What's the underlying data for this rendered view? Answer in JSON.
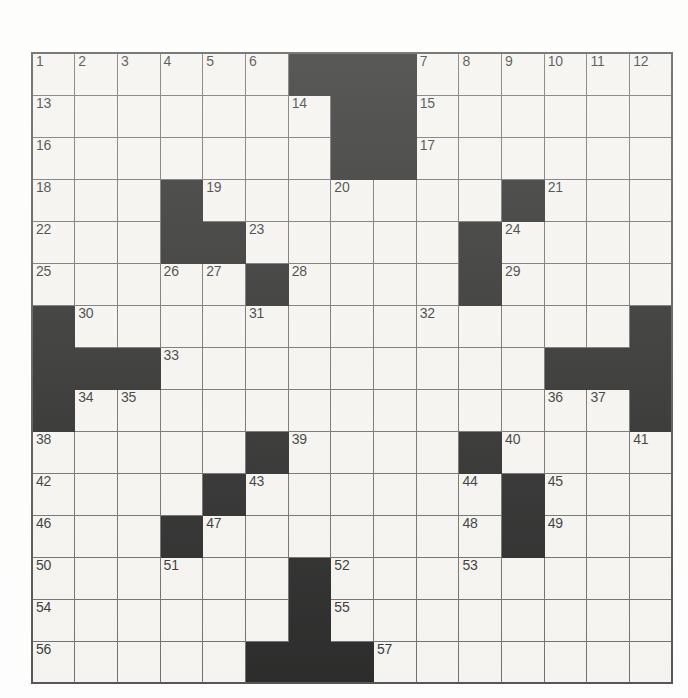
{
  "page": {
    "background_color": "#ffffff",
    "width": 688,
    "height": 698
  },
  "grid": {
    "name": "crossword-grid",
    "rows": 15,
    "cols": 15,
    "cell_color": "#f4f3f0",
    "block_color": "#080808",
    "line_color": "#5a5a58",
    "number_color": "#141414",
    "blocks": [
      [
        6,
        7,
        8
      ],
      [
        7,
        8
      ],
      [
        7,
        8
      ],
      [
        3,
        11
      ],
      [
        3,
        4,
        10
      ],
      [
        5,
        10
      ],
      [
        0,
        14
      ],
      [
        0,
        1,
        2,
        12,
        13,
        14
      ],
      [
        0,
        14
      ],
      [
        5,
        10
      ],
      [
        4,
        11
      ],
      [
        3,
        11
      ],
      [
        6
      ],
      [
        6
      ],
      [
        5,
        6,
        7
      ]
    ],
    "numbers": [
      {
        "row": 0,
        "col": 0,
        "label": "1"
      },
      {
        "row": 0,
        "col": 1,
        "label": "2"
      },
      {
        "row": 0,
        "col": 2,
        "label": "3"
      },
      {
        "row": 0,
        "col": 3,
        "label": "4"
      },
      {
        "row": 0,
        "col": 4,
        "label": "5"
      },
      {
        "row": 0,
        "col": 5,
        "label": "6"
      },
      {
        "row": 0,
        "col": 9,
        "label": "7"
      },
      {
        "row": 0,
        "col": 10,
        "label": "8"
      },
      {
        "row": 0,
        "col": 11,
        "label": "9"
      },
      {
        "row": 0,
        "col": 12,
        "label": "10"
      },
      {
        "row": 0,
        "col": 13,
        "label": "11"
      },
      {
        "row": 0,
        "col": 14,
        "label": "12"
      },
      {
        "row": 1,
        "col": 0,
        "label": "13"
      },
      {
        "row": 1,
        "col": 6,
        "label": "14"
      },
      {
        "row": 1,
        "col": 9,
        "label": "15"
      },
      {
        "row": 2,
        "col": 0,
        "label": "16"
      },
      {
        "row": 2,
        "col": 9,
        "label": "17"
      },
      {
        "row": 3,
        "col": 0,
        "label": "18"
      },
      {
        "row": 3,
        "col": 4,
        "label": "19"
      },
      {
        "row": 3,
        "col": 7,
        "label": "20"
      },
      {
        "row": 3,
        "col": 12,
        "label": "21"
      },
      {
        "row": 4,
        "col": 0,
        "label": "22"
      },
      {
        "row": 4,
        "col": 5,
        "label": "23"
      },
      {
        "row": 4,
        "col": 11,
        "label": "24"
      },
      {
        "row": 5,
        "col": 0,
        "label": "25"
      },
      {
        "row": 5,
        "col": 3,
        "label": "26"
      },
      {
        "row": 5,
        "col": 4,
        "label": "27"
      },
      {
        "row": 5,
        "col": 6,
        "label": "28"
      },
      {
        "row": 5,
        "col": 11,
        "label": "29"
      },
      {
        "row": 6,
        "col": 1,
        "label": "30"
      },
      {
        "row": 6,
        "col": 5,
        "label": "31"
      },
      {
        "row": 6,
        "col": 9,
        "label": "32"
      },
      {
        "row": 7,
        "col": 3,
        "label": "33"
      },
      {
        "row": 8,
        "col": 1,
        "label": "34"
      },
      {
        "row": 8,
        "col": 2,
        "label": "35"
      },
      {
        "row": 8,
        "col": 12,
        "label": "36"
      },
      {
        "row": 8,
        "col": 13,
        "label": "37"
      },
      {
        "row": 9,
        "col": 0,
        "label": "38"
      },
      {
        "row": 9,
        "col": 6,
        "label": "39"
      },
      {
        "row": 9,
        "col": 11,
        "label": "40"
      },
      {
        "row": 9,
        "col": 14,
        "label": "41"
      },
      {
        "row": 10,
        "col": 0,
        "label": "42"
      },
      {
        "row": 10,
        "col": 5,
        "label": "43"
      },
      {
        "row": 10,
        "col": 10,
        "label": "44"
      },
      {
        "row": 10,
        "col": 12,
        "label": "45"
      },
      {
        "row": 11,
        "col": 0,
        "label": "46"
      },
      {
        "row": 11,
        "col": 4,
        "label": "47"
      },
      {
        "row": 11,
        "col": 10,
        "label": "48"
      },
      {
        "row": 11,
        "col": 12,
        "label": "49"
      },
      {
        "row": 12,
        "col": 0,
        "label": "50"
      },
      {
        "row": 12,
        "col": 3,
        "label": "51"
      },
      {
        "row": 12,
        "col": 7,
        "label": "52"
      },
      {
        "row": 12,
        "col": 10,
        "label": "53"
      },
      {
        "row": 13,
        "col": 0,
        "label": "54"
      },
      {
        "row": 13,
        "col": 7,
        "label": "55"
      },
      {
        "row": 14,
        "col": 0,
        "label": "56"
      },
      {
        "row": 14,
        "col": 8,
        "label": "57"
      }
    ],
    "entries": []
  }
}
